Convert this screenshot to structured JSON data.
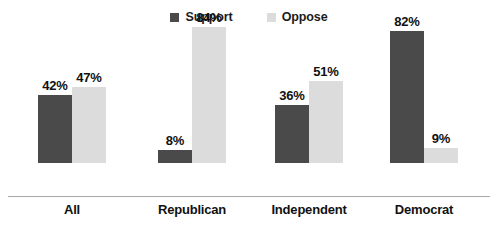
{
  "chart_data": {
    "type": "bar",
    "title": "",
    "subtitle": "",
    "xlabel": "",
    "ylabel": "",
    "ylim": [
      0,
      100
    ],
    "grid": false,
    "legend_position": "top-center",
    "categories": [
      "All",
      "Republican",
      "Independent",
      "Democrat"
    ],
    "series": [
      {
        "name": "Support",
        "color": "#4a4a4a",
        "values": [
          42,
          8,
          36,
          82
        ],
        "labels": [
          "42%",
          "8%",
          "36%",
          "82%"
        ]
      },
      {
        "name": "Oppose",
        "color": "#dcdcdc",
        "values": [
          47,
          84,
          51,
          9
        ],
        "labels": [
          "47%",
          "84%",
          "51%",
          "9%"
        ]
      }
    ]
  },
  "legend": {
    "items": [
      {
        "label": "Support",
        "swatch": "legend-swatch-support"
      },
      {
        "label": "Oppose",
        "swatch": "legend-swatch-oppose"
      }
    ]
  },
  "axis": {
    "baseline_color": "#a8a8a8"
  }
}
